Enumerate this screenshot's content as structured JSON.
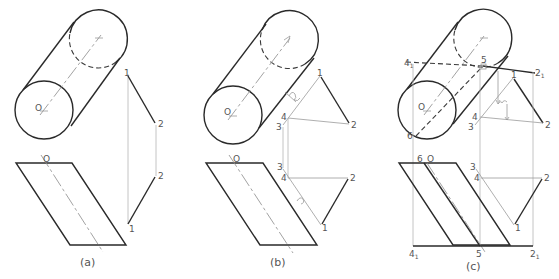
{
  "figure": {
    "panels": [
      {
        "id": "a",
        "caption": "(a)",
        "labels": {
          "center": "O",
          "center_top": "O",
          "p1_top": "1",
          "p2_top": "2",
          "p2_bottom": "2",
          "p1_bottom": "1"
        }
      },
      {
        "id": "b",
        "caption": "(b)",
        "labels": {
          "center": "O",
          "center_top": "O",
          "p1_top": "1",
          "p2_top": "2",
          "p3_top": "3",
          "p4_top": "4",
          "p3_bottom": "3",
          "p4_bottom": "4",
          "p2_bottom": "2",
          "p1_bottom": "1"
        }
      },
      {
        "id": "c",
        "caption": "(c)",
        "labels": {
          "center": "O",
          "center_top": "O",
          "p41_top": "4",
          "p41_top_sub": "1",
          "p5_top": "5",
          "p21_top": "2",
          "p21_top_sub": "1",
          "p6_front": "6",
          "p6_top": "6",
          "p1_top": "1",
          "p2_top": "2",
          "p3_top": "3",
          "p4_top": "4",
          "p3_bottom": "3",
          "p4_bottom": "4",
          "p2_bottom": "2",
          "p1_bottom": "1",
          "p41_bottom": "4",
          "p41_bottom_sub": "1",
          "p5_bottom": "5",
          "p21_bottom": "2",
          "p21_bottom_sub": "1"
        }
      }
    ],
    "colors": {
      "object_line": "#2a2a2a",
      "construction_line": "#b5b5b5",
      "label_text": "#555555"
    }
  }
}
